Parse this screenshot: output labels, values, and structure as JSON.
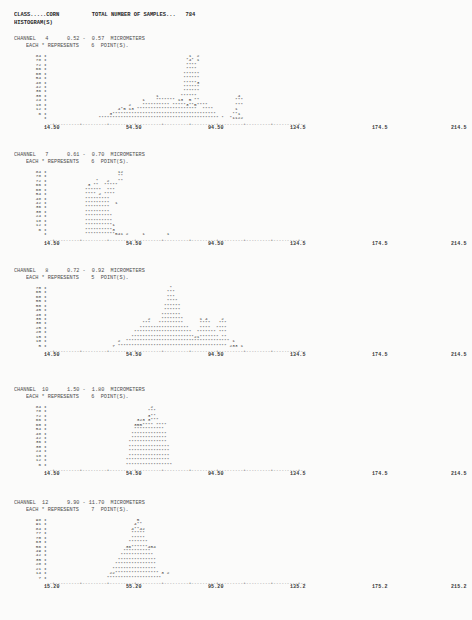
{
  "document": {
    "class_label": "CLASS.....CORN",
    "total_samples_label": "TOTAL NUMBER OF SAMPLES...",
    "total_samples_value": "784",
    "section_title": "HISTOGRAM(S)"
  },
  "histograms": [
    {
      "channel_label": "CHANNEL   4",
      "range_label": "0.52 -  0.57  MICROMETERS",
      "scale_label": "EACH * REPRESENTS    6  POINT(S).",
      "y_ticks": [
        "84",
        "78",
        "72",
        "66",
        "60",
        "54",
        "48",
        "42",
        "36",
        "30",
        "24",
        "18",
        "12",
        "6"
      ],
      "x_ticks": [
        "14.50",
        "54.50",
        "94.50",
        "134.5",
        "174.5",
        "214.5"
      ],
      "rows": [
        "                                                    1  2",
        "                                                   *4* 1",
        "                                                   ****",
        "                                                   ****",
        "                                                  ******",
        "                                                  ******",
        "                                                  *****3",
        "                                                  ******",
        "                                                  ******",
        "                                        1        ******               4",
        "                                   1    ******* 13  5 **             ***",
        "                              2    ********** *****3**5****          ***",
        "                          4*5 13 **********************  ****        1",
        "                       3**************************************      **1",
        "                   ******************************************** *  *1122"
      ],
      "axis": "--+----.----+----.----+----.----+----.----+----.----+----.----+----.----+----.----+----.----+--"
    },
    {
      "channel_label": "CHANNEL   7",
      "range_label": "0.61 -  0.70  MICROMETERS",
      "scale_label": "EACH * REPRESENTS    6  POINT(S).",
      "y_ticks": [
        "84",
        "78",
        "72",
        "66",
        "60",
        "54",
        "48",
        "42",
        "36",
        "30",
        "24",
        "18",
        "12",
        "6"
      ],
      "x_ticks": [
        "14.50",
        "54.50",
        "94.50",
        "134.5",
        "174.5",
        "214.5"
      ],
      "rows": [
        "                          12",
        "                          **",
        "                  *   2   **",
        "               3 **  *****",
        "              ******  ***",
        "              **** 2 ****",
        "              *********",
        "              *********  1",
        "              *********",
        "              *********",
        "              **********",
        "              **********",
        "              **********1",
        "              **********3",
        "              ***********541 2     1        1"
      ],
      "axis": "--+----.----+----.----+----.----+----.----+----.----+----.----+----.----+----.----+----.----+--"
    },
    {
      "channel_label": "CHANNEL   8",
      "range_label": "0.72 -  0.92  MICROMETERS",
      "scale_label": "EACH * REPRESENTS    5  POINT(S).",
      "y_ticks": [
        "70",
        "65",
        "60",
        "55",
        "50",
        "45",
        "40",
        "35",
        "30",
        "25",
        "20",
        "15",
        "10",
        "5"
      ],
      "x_ticks": [
        "14.50",
        "54.50",
        "94.50",
        "134.5",
        "174.5",
        "214.5"
      ],
      "rows": [
        "                                             *",
        "                                            ***",
        "                                            ***",
        "                                            ****",
        "                                           ******",
        "                                           ******",
        "                                          *******",
        "                                     2    ********      1 4     2",
        "                                   ***   *********      ****   ***",
        "                                  ******************    ****  ****",
        "                                *********************  ******* ***",
        "                               ***********************21******* **",
        "                          2  ************************************** 1",
        "                        7 **************************************** 233 1"
      ],
      "axis": "--+----.----+----.----+----.----+----.----+----.----+----.----+----.----+----.----+----.----+--"
    },
    {
      "channel_label": "CHANNEL  10",
      "range_label": "1.50 -  1.80  MICROMETERS",
      "scale_label": "EACH * REPRESENTS    6  POINT(S).",
      "y_ticks": [
        "84",
        "78",
        "72",
        "66",
        "60",
        "54",
        "48",
        "42",
        "36",
        "30",
        "24",
        "18",
        "12",
        "6"
      ],
      "x_ticks": [
        "14.50",
        "54.50",
        "94.50",
        "134.5",
        "174.5",
        "214.5"
      ],
      "rows": [
        "                                      2",
        "                                     ***",
        "                                     3**",
        "                                 323 3***",
        "                                355**** ****",
        "                                ***********",
        "                               *************",
        "                               *************",
        "                              **************",
        "                              ***************",
        "                              ***************",
        "                              ***************",
        "                             ****************",
        "                             *****************"
      ],
      "axis": "--+----.----+----.----+----.----+----.----+----.----+----.----+----.----+----.----+----.----+--"
    },
    {
      "channel_label": "CHANNEL  12",
      "range_label": "9.90 - 11.70  MICROMETERS",
      "scale_label": "EACH * REPRESENTS    7  POINT(S).",
      "y_ticks": [
        "98",
        "91",
        "84",
        "77",
        "70",
        "63",
        "56",
        "49",
        "42",
        "35",
        "28",
        "21",
        "14",
        "7"
      ],
      "x_ticks": [
        "15.20",
        "55.20",
        "95.20",
        "135.2",
        "175.2",
        "215.2"
      ],
      "rows": [
        "                                 5",
        "                                4**",
        "                               4**42",
        "                               *****",
        "                               *****",
        "                              *******",
        "                             36******454",
        "                            **********",
        "                           ************",
        "                          **************",
        "                         ***************",
        "                        ****************",
        "                       22**************** 3 2",
        "                      ********************"
      ],
      "axis": "--+----.----+----.----+----.----+----.----+----.----+----.----+----.----+----.----+----.----+--"
    }
  ]
}
